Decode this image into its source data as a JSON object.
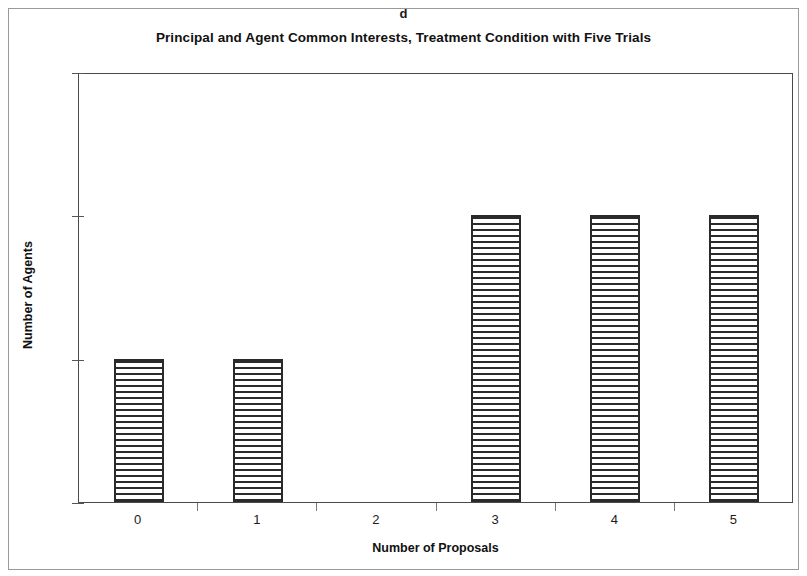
{
  "figure": {
    "panel_letter": "d"
  },
  "chart_data": {
    "type": "bar",
    "title": "Principal and Agent Common Interests, Treatment Condition with Five Trials",
    "xlabel": "Number of Proposals",
    "ylabel": "Number of Agents",
    "categories": [
      "0",
      "1",
      "2",
      "3",
      "4",
      "5"
    ],
    "values": [
      1,
      1,
      0,
      2,
      2,
      2
    ],
    "xtick_labels": [
      "0",
      "1",
      "2",
      "3",
      "4",
      "5"
    ],
    "ytick_labels": [
      "0",
      "1",
      "2",
      "3"
    ],
    "ytick_values": [
      0,
      1,
      2,
      3
    ],
    "ylim": [
      0,
      3
    ],
    "grid": false,
    "legend": null,
    "bar_fill": "horizontal-hatch",
    "bar_edge_color": "#2a2a2a",
    "axis_color": "#4a4a4a",
    "background_color": "#ffffff"
  }
}
